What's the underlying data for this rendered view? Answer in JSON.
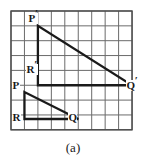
{
  "figure": {
    "caption": "(a)",
    "grid": {
      "cols": 9,
      "rows": 8,
      "x0": 11,
      "y0": 11,
      "cell_w": 13.45,
      "cell_h": 14.85,
      "line_color": "#6b6b6b",
      "border_color": "#4a4a4a"
    },
    "shape_color": "#1a1a1a",
    "labels": [
      {
        "name": "label-p-prime",
        "text": "P",
        "prime": "′",
        "x": 28,
        "y": 14
      },
      {
        "name": "label-r-prime",
        "text": "R",
        "prime": "′",
        "x": 27,
        "y": 66
      },
      {
        "name": "label-p",
        "text": "P",
        "prime": "",
        "x": 13,
        "y": 82
      },
      {
        "name": "label-q-prime",
        "text": "Q",
        "prime": "′",
        "x": 127,
        "y": 82
      },
      {
        "name": "label-r",
        "text": "R",
        "prime": "",
        "x": 13,
        "y": 113
      },
      {
        "name": "label-q",
        "text": "Q",
        "prime": "",
        "x": 69,
        "y": 113
      }
    ],
    "triangles": [
      {
        "name": "triangle-p-prime-r-prime-q-prime",
        "points": "38,25 38,79 132,79",
        "stroke_width": 2.3
      },
      {
        "name": "triangle-p-r-q",
        "points": "25,92 25,119 79,119",
        "stroke_width": 2.3
      }
    ]
  }
}
